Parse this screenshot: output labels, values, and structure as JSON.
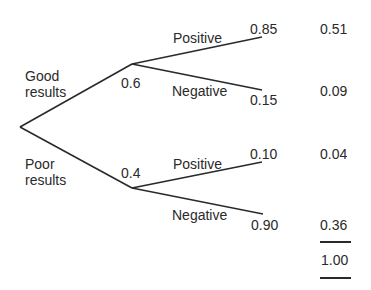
{
  "diagram": {
    "type": "probability-tree",
    "first_branch": [
      {
        "label_line1": "Good",
        "label_line2": "results",
        "probability": "0.6"
      },
      {
        "label_line1": "Poor",
        "label_line2": "results",
        "probability": "0.4"
      }
    ],
    "second_branch": {
      "good": [
        {
          "label": "Positive",
          "probability": "0.85",
          "joint": "0.51"
        },
        {
          "label": "Negative",
          "probability": "0.15",
          "joint": "0.09"
        }
      ],
      "poor": [
        {
          "label": "Positive",
          "probability": "0.10",
          "joint": "0.04"
        },
        {
          "label": "Negative",
          "probability": "0.90",
          "joint": "0.36"
        }
      ]
    },
    "total": "1.00",
    "line_color": "#2a2a2a"
  }
}
